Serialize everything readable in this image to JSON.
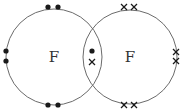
{
  "diagram": {
    "type": "dot-and-cross",
    "molecule": "F2",
    "atoms": [
      {
        "symbol": "F",
        "cx": 54,
        "cy": 57,
        "r": 48,
        "electron": "dot",
        "lone_electrons": [
          [
            48,
            7
          ],
          [
            58,
            7
          ],
          [
            6,
            51
          ],
          [
            6,
            61
          ],
          [
            48,
            105
          ],
          [
            58,
            105
          ]
        ]
      },
      {
        "symbol": "F",
        "cx": 130,
        "cy": 57,
        "r": 47,
        "electron": "cross",
        "lone_electrons": [
          [
            124,
            7
          ],
          [
            134,
            7
          ],
          [
            176,
            52
          ],
          [
            176,
            61
          ],
          [
            124,
            105
          ],
          [
            134,
            105
          ]
        ]
      }
    ],
    "shared_pair": {
      "dot": [
        92,
        51
      ],
      "cross": [
        92,
        62
      ]
    },
    "colors": {
      "line": "#6b6b6b",
      "mark": "#1a1a1a"
    }
  }
}
